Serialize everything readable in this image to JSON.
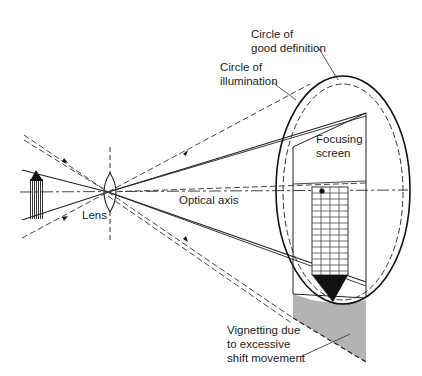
{
  "diagram": {
    "labels": {
      "good_definition_line1": "Circle of",
      "good_definition_line2": "good definition",
      "illumination_line1": "Circle of",
      "illumination_line2": "illumination",
      "focusing_line1": "Focusing",
      "focusing_line2": "screen",
      "optical_axis": "Optical axis",
      "lens": "Lens",
      "vignetting_line1": "Vignetting due",
      "vignetting_line2": "to excessive",
      "vignetting_line3": "shift movement"
    },
    "colors": {
      "line": "#222222",
      "dashed": "#555555",
      "vignetting_fill": "#b3b3b3",
      "background": "#ffffff"
    }
  }
}
